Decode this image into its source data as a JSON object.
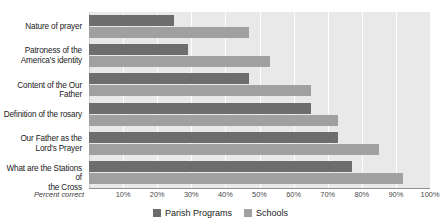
{
  "title_sliver": "",
  "axis": {
    "percent_correct_label": "Percent correct",
    "ticks": [
      "10%",
      "20%",
      "30%",
      "40%",
      "50%",
      "60%",
      "70%",
      "80%",
      "90%",
      "100%"
    ]
  },
  "legend": {
    "position": "bottom-center",
    "items": [
      {
        "label": "Parish Programs",
        "color": "#6d6d6d",
        "icon": "square-swatch-icon"
      },
      {
        "label": "Schools",
        "color": "#a0a0a0",
        "icon": "square-swatch-icon"
      }
    ]
  },
  "chart_data": {
    "type": "bar",
    "orientation": "horizontal",
    "title": "",
    "xlabel": "Percent correct",
    "ylabel": "",
    "xlim": [
      0,
      100
    ],
    "xticks": [
      10,
      20,
      30,
      40,
      50,
      60,
      70,
      80,
      90,
      100
    ],
    "grid": true,
    "legend_position": "bottom-center",
    "categories": [
      "Nature of prayer",
      "Patroness of the America's identity",
      "Content of the Our Father",
      "Definition of the rosary",
      "Our Father as the Lord's Prayer",
      "What are the Stations of the Cross"
    ],
    "category_lines": [
      [
        "Nature of prayer"
      ],
      [
        "Patroness of the",
        "America's identity"
      ],
      [
        "Content of the Our Father"
      ],
      [
        "Definition of the rosary"
      ],
      [
        "Our Father as the",
        "Lord's Prayer"
      ],
      [
        "What are the Stations of",
        "the Cross"
      ]
    ],
    "series": [
      {
        "name": "Parish Programs",
        "color": "#6d6d6d",
        "values": [
          25,
          29,
          47,
          65,
          73,
          77
        ]
      },
      {
        "name": "Schools",
        "color": "#a0a0a0",
        "values": [
          47,
          53,
          65,
          73,
          85,
          92
        ]
      }
    ]
  }
}
